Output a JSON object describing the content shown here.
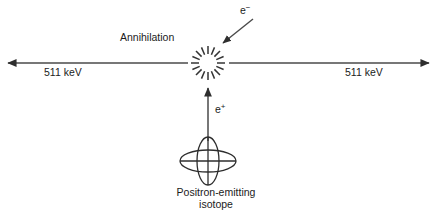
{
  "figure": {
    "type": "physics-schematic",
    "background_color": "#ffffff",
    "stroke_color": "#3a3a3a",
    "text_color": "#1b1b1b"
  },
  "labels": {
    "annihilation": "Annihilation",
    "gamma_left": "511 keV",
    "gamma_right": "511 keV",
    "electron_base": "e",
    "electron_charge": "−",
    "positron_base": "e",
    "positron_charge": "+",
    "isotope_line1": "Positron-emitting",
    "isotope_line2": "isotope"
  },
  "geometry": {
    "annihilation_center": {
      "x": 208,
      "y": 63
    },
    "starburst_spokes": 16,
    "starburst_inner_radius": 9,
    "starburst_outer_radius": 17,
    "gamma_axis_y": 63,
    "gamma_left_arrow_tip": {
      "x": 6,
      "y": 63
    },
    "gamma_left_arrow_tail": {
      "x": 188,
      "y": 63
    },
    "gamma_right_arrow_tip": {
      "x": 431,
      "y": 63
    },
    "gamma_right_arrow_tail": {
      "x": 229,
      "y": 63
    },
    "positron_arrow_tail": {
      "x": 208,
      "y": 141
    },
    "positron_arrow_tip": {
      "x": 208,
      "y": 86
    },
    "electron_arrow_tail": {
      "x": 253,
      "y": 19
    },
    "electron_arrow_tip": {
      "x": 221,
      "y": 45
    },
    "isotope_center": {
      "x": 208,
      "y": 161
    },
    "isotope_horizontal_ellipse": {
      "rx": 28,
      "ry": 11
    },
    "isotope_vertical_ellipse": {
      "rx": 11,
      "ry": 24
    }
  }
}
